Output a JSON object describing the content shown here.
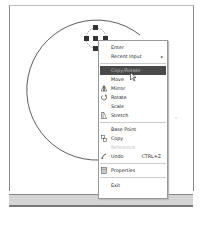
{
  "canvas": {
    "grips": [
      "center",
      "top",
      "left",
      "right",
      "bottom"
    ]
  },
  "context_menu": {
    "items": [
      {
        "label": "Enter",
        "underline": "E"
      },
      {
        "label": "Recent Input",
        "submenu": true
      },
      {
        "label": "Copy/Rotate",
        "highlighted": true
      },
      {
        "label": "Move"
      },
      {
        "label": "Mirror",
        "icon": "mirror-icon"
      },
      {
        "label": "Rotate",
        "icon": "rotate-icon"
      },
      {
        "label": "Scale"
      },
      {
        "label": "Stretch",
        "icon": "stretch-icon"
      },
      {
        "label": "Base Point"
      },
      {
        "label": "Copy",
        "icon": "copy-icon"
      },
      {
        "label": "Reference",
        "disabled": true
      },
      {
        "label": "Undo",
        "icon": "undo-icon",
        "shortcut": "CTRL+Z"
      },
      {
        "label": "Properties",
        "icon": "properties-icon"
      },
      {
        "label": "Exit"
      }
    ],
    "submenu_arrow": "▸"
  },
  "colors": {
    "highlight_bg": "#4a4a4a",
    "menu_border": "#999999",
    "statusbar": "#d4d4d4"
  }
}
